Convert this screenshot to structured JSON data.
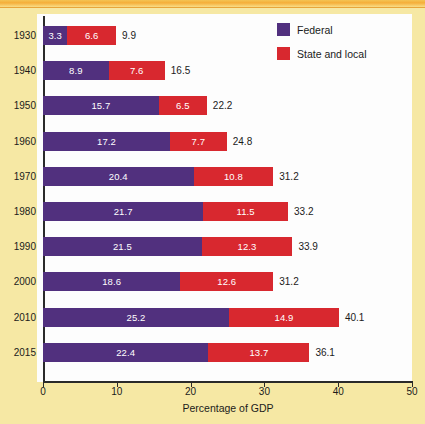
{
  "chart_data": {
    "type": "bar",
    "orientation": "horizontal",
    "stacked": true,
    "title": "",
    "xlabel": "Percentage of GDP",
    "ylabel": "",
    "xlim": [
      0,
      50
    ],
    "xticks": [
      0,
      10,
      20,
      30,
      40,
      50
    ],
    "xtick_labels": [
      "0",
      "10",
      "20",
      "30",
      "40",
      "50"
    ],
    "grid": false,
    "legend_position": "top-right",
    "categories": [
      "1930",
      "1940",
      "1950",
      "1960",
      "1970",
      "1980",
      "1990",
      "2000",
      "2010",
      "2015"
    ],
    "series": [
      {
        "name": "Federal",
        "color": "#51307e",
        "values": [
          3.3,
          8.9,
          15.7,
          17.2,
          20.4,
          21.7,
          21.5,
          18.6,
          25.2,
          22.4
        ]
      },
      {
        "name": "State and local",
        "color": "#d8282f",
        "values": [
          6.6,
          7.6,
          6.5,
          7.7,
          10.8,
          11.5,
          12.3,
          12.6,
          14.9,
          13.7
        ]
      }
    ],
    "totals": [
      9.9,
      16.5,
      22.2,
      24.8,
      31.2,
      33.2,
      33.9,
      31.2,
      40.1,
      36.1
    ],
    "rows": [
      {
        "year": "1930",
        "federal": "3.3",
        "state": "6.6",
        "total": "9.9"
      },
      {
        "year": "1940",
        "federal": "8.9",
        "state": "7.6",
        "total": "16.5"
      },
      {
        "year": "1950",
        "federal": "15.7",
        "state": "6.5",
        "total": "22.2"
      },
      {
        "year": "1960",
        "federal": "17.2",
        "state": "7.7",
        "total": "24.8"
      },
      {
        "year": "1970",
        "federal": "20.4",
        "state": "10.8",
        "total": "31.2"
      },
      {
        "year": "1980",
        "federal": "21.7",
        "state": "11.5",
        "total": "33.2"
      },
      {
        "year": "1990",
        "federal": "21.5",
        "state": "12.3",
        "total": "33.9"
      },
      {
        "year": "2000",
        "federal": "18.6",
        "state": "12.6",
        "total": "31.2"
      },
      {
        "year": "2010",
        "federal": "25.2",
        "state": "14.9",
        "total": "40.1"
      },
      {
        "year": "2015",
        "federal": "22.4",
        "state": "13.7",
        "total": "36.1"
      }
    ]
  },
  "legend": {
    "items": [
      {
        "label": "Federal",
        "color": "#51307e",
        "swatch_name": "legend-swatch-federal"
      },
      {
        "label": "State and local",
        "color": "#d8282f",
        "swatch_name": "legend-swatch-state-and-local"
      }
    ]
  },
  "axis": {
    "x_title": "Percentage of GDP",
    "x_tick_labels": [
      "0",
      "10",
      "20",
      "30",
      "40",
      "50"
    ]
  },
  "colors": {
    "federal": "#51307e",
    "state_and_local": "#d8282f",
    "page_background": "#f6e8a4",
    "panel_background": "#fdfdfd",
    "axis": "#2a2a2a"
  }
}
